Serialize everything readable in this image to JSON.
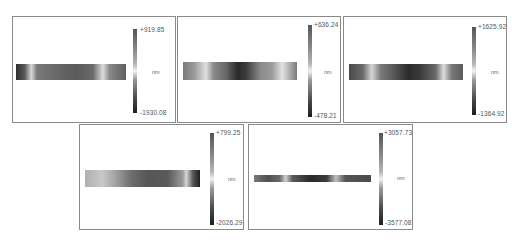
{
  "panels": [
    {
      "id": 1,
      "max_label": "+919.85",
      "min_label": "-1930.08",
      "unit": "nm"
    },
    {
      "id": 2,
      "max_label": "+636.24",
      "min_label": "-478.21",
      "unit": "nm"
    },
    {
      "id": 3,
      "max_label": "+1625.92",
      "min_label": "-1364.92",
      "unit": "nm"
    },
    {
      "id": 4,
      "max_label": "+799.25",
      "min_label": "-2026.29",
      "unit": "nm"
    },
    {
      "id": 5,
      "max_label": "+3057.73",
      "min_label": "-3577.08",
      "unit": "nm"
    }
  ],
  "colors": {
    "panel_border": "#8a8a8a",
    "background": "#ffffff",
    "label_text": "#555555"
  }
}
